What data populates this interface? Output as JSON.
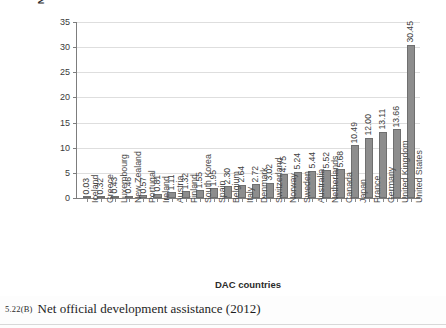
{
  "chart_data": {
    "type": "bar",
    "title": "",
    "xlabel": "DAC countries",
    "ylabel": "Net ODA ($US billions)",
    "ylim": [
      0,
      35
    ],
    "yticks": [
      0,
      5,
      10,
      15,
      20,
      25,
      30,
      35
    ],
    "grid": true,
    "legend": "none",
    "bar_color": "#8d8d8d",
    "categories": [
      "Iceland",
      "Greece",
      "Luxembourg",
      "New Zealand",
      "Portugal",
      "Ireland",
      "Austria",
      "Finland",
      "South Korea",
      "Spain",
      "Belgium",
      "Italy",
      "Denmark",
      "Switzerland",
      "Norway",
      "Sweden",
      "Australia",
      "Netherlands",
      "Canada",
      "Japan",
      "France",
      "Germany",
      "United Kingdom",
      "United States"
    ],
    "values": [
      0.03,
      0.32,
      0.43,
      0.46,
      0.57,
      0.81,
      1.11,
      1.32,
      1.55,
      1.95,
      2.3,
      2.64,
      2.72,
      3.02,
      4.75,
      5.24,
      5.44,
      5.52,
      5.68,
      10.49,
      12.0,
      13.11,
      13.66,
      30.45
    ],
    "data_labels": [
      "0.03",
      "0.32",
      "0.43",
      "0.46",
      "0.57",
      "0.81",
      "1.11",
      "1.32",
      "1.55",
      "1.95",
      "2.30",
      "2.64",
      "2.72",
      "3.02",
      "4.75",
      "5.24",
      "5.44",
      "5.52",
      "5.68",
      "10.49",
      "12.00",
      "13.11",
      "13.66",
      "30.45"
    ]
  },
  "caption": {
    "number": "5.22(B)",
    "text": "Net official development assistance (2012)"
  }
}
